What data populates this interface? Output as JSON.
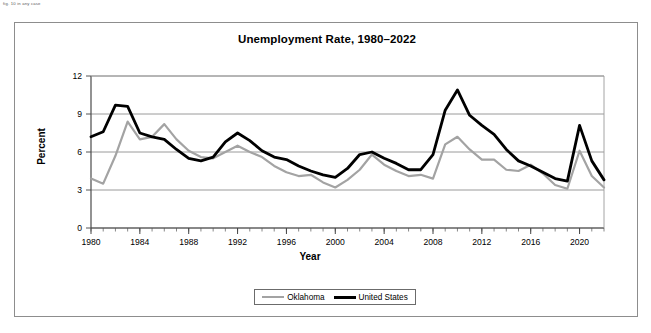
{
  "page": {
    "corner_note": "fig. 10 in any case"
  },
  "figure": {
    "title": "Unemployment Rate, 1980–2022",
    "xlabel": "Year",
    "ylabel": "Percent"
  },
  "legend": {
    "position": "bottom-center",
    "items": [
      {
        "label": "Oklahoma",
        "color": "#a3a3a3"
      },
      {
        "label": "United States",
        "color": "#000000"
      }
    ]
  },
  "chart_data": {
    "type": "line",
    "title": "Unemployment Rate, 1980–2022",
    "xlabel": "Year",
    "ylabel": "Percent",
    "xlim": [
      1980,
      2022
    ],
    "ylim": [
      0,
      12
    ],
    "yticks": [
      0,
      3,
      6,
      9,
      12
    ],
    "xticks": [
      1980,
      1984,
      1988,
      1992,
      1996,
      2000,
      2004,
      2008,
      2012,
      2016,
      2020
    ],
    "x_minor_tick_interval": 1,
    "grid": "horizontal",
    "legend_position": "bottom-center",
    "x": [
      1980,
      1981,
      1982,
      1983,
      1984,
      1985,
      1986,
      1987,
      1988,
      1989,
      1990,
      1991,
      1992,
      1993,
      1994,
      1995,
      1996,
      1997,
      1998,
      1999,
      2000,
      2001,
      2002,
      2003,
      2004,
      2005,
      2006,
      2007,
      2008,
      2009,
      2010,
      2011,
      2012,
      2013,
      2014,
      2015,
      2016,
      2017,
      2018,
      2019,
      2020,
      2021,
      2022
    ],
    "series": [
      {
        "name": "Oklahoma",
        "color": "#a3a3a3",
        "values": [
          3.9,
          3.5,
          5.7,
          8.4,
          7.0,
          7.2,
          8.2,
          7.0,
          6.1,
          5.6,
          5.5,
          6.0,
          6.5,
          6.0,
          5.6,
          4.9,
          4.4,
          4.1,
          4.2,
          3.6,
          3.2,
          3.8,
          4.6,
          5.8,
          5.0,
          4.5,
          4.1,
          4.2,
          3.9,
          6.6,
          7.2,
          6.2,
          5.4,
          5.4,
          4.6,
          4.5,
          5.0,
          4.3,
          3.4,
          3.1,
          6.1,
          4.1,
          3.2
        ],
        "style": "solid",
        "width": 2.2
      },
      {
        "name": "United States",
        "color": "#000000",
        "values": [
          7.2,
          7.6,
          9.7,
          9.6,
          7.5,
          7.2,
          7.0,
          6.2,
          5.5,
          5.3,
          5.6,
          6.8,
          7.5,
          6.9,
          6.1,
          5.6,
          5.4,
          4.9,
          4.5,
          4.2,
          4.0,
          4.7,
          5.8,
          6.0,
          5.5,
          5.1,
          4.6,
          4.6,
          5.8,
          9.3,
          10.9,
          8.9,
          8.1,
          7.4,
          6.2,
          5.3,
          4.9,
          4.4,
          3.9,
          3.7,
          8.1,
          5.3,
          3.8
        ],
        "style": "solid",
        "width": 2.8
      }
    ]
  }
}
